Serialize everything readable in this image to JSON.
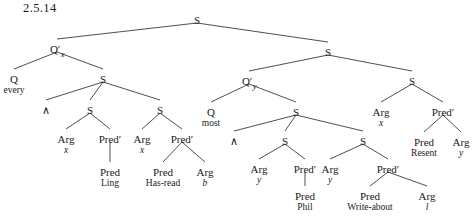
{
  "figure": {
    "example_number": "2.5.14",
    "width": 476,
    "height": 221,
    "edge_color": "#3a3a44",
    "text_color": "#1a1a1a"
  },
  "nodes": {
    "root_s": {
      "label": "S",
      "sub": "",
      "word": "",
      "x": 197,
      "y": 11
    },
    "left_qprime": {
      "label": "Q′",
      "sub": "x",
      "word": "",
      "x": 57,
      "y": 40
    },
    "left_q": {
      "label": "Q",
      "sub": "",
      "word": "every",
      "x": 14,
      "y": 70
    },
    "left_s1": {
      "label": "S",
      "sub": "",
      "word": "",
      "x": 103,
      "y": 70
    },
    "left_conj": {
      "label": "∧",
      "sub": "",
      "word": "",
      "x": 46,
      "y": 101
    },
    "left_s2": {
      "label": "S",
      "sub": "",
      "word": "",
      "x": 90,
      "y": 101
    },
    "left_s3": {
      "label": "S",
      "sub": "",
      "word": "",
      "x": 160,
      "y": 101
    },
    "left_arg_x1": {
      "label": "Arg",
      "sub": "",
      "word": "x",
      "x": 66,
      "y": 130
    },
    "left_predprime1": {
      "label": "Pred′",
      "sub": "",
      "word": "",
      "x": 110,
      "y": 130
    },
    "left_pred_ling": {
      "label": "Pred",
      "sub": "",
      "word": "Ling",
      "x": 110,
      "y": 163
    },
    "left_arg_x2": {
      "label": "Arg",
      "sub": "",
      "word": "x",
      "x": 142,
      "y": 130
    },
    "left_predprime2": {
      "label": "Pred′",
      "sub": "",
      "word": "",
      "x": 182,
      "y": 130
    },
    "left_pred_hasread": {
      "label": "Pred",
      "sub": "",
      "word": "Has-read",
      "x": 163,
      "y": 163
    },
    "left_arg_b": {
      "label": "Arg",
      "sub": "",
      "word": "b",
      "x": 205,
      "y": 163
    },
    "right_s": {
      "label": "S",
      "sub": "",
      "word": "",
      "x": 328,
      "y": 43
    },
    "right_qprime": {
      "label": "Q′",
      "sub": "y",
      "word": "",
      "x": 249,
      "y": 72
    },
    "right_q": {
      "label": "Q",
      "sub": "",
      "word": "most",
      "x": 211,
      "y": 103
    },
    "right_s1": {
      "label": "S",
      "sub": "",
      "word": "",
      "x": 296,
      "y": 103
    },
    "right_conj": {
      "label": "∧",
      "sub": "",
      "word": "",
      "x": 234,
      "y": 132
    },
    "right_s2": {
      "label": "S",
      "sub": "",
      "word": "",
      "x": 285,
      "y": 132
    },
    "right_s3": {
      "label": "S",
      "sub": "",
      "word": "",
      "x": 363,
      "y": 132
    },
    "right_arg_y1": {
      "label": "Arg",
      "sub": "",
      "word": "y",
      "x": 259,
      "y": 160
    },
    "right_predprime1": {
      "label": "Pred′",
      "sub": "",
      "word": "",
      "x": 305,
      "y": 160
    },
    "right_pred_phil": {
      "label": "Pred",
      "sub": "",
      "word": "Phil",
      "x": 305,
      "y": 187
    },
    "right_arg_y2": {
      "label": "Arg",
      "sub": "",
      "word": "y",
      "x": 330,
      "y": 160
    },
    "right_predprime2": {
      "label": "Pred′",
      "sub": "",
      "word": "",
      "x": 388,
      "y": 160
    },
    "right_pred_write": {
      "label": "Pred",
      "sub": "",
      "word": "Write-about",
      "x": 370,
      "y": 187
    },
    "right_arg_l": {
      "label": "Arg",
      "sub": "",
      "word": "l",
      "x": 427,
      "y": 187
    },
    "far_arg_x": {
      "label": "Arg",
      "sub": "",
      "word": "x",
      "x": 381,
      "y": 103
    },
    "far_predprime": {
      "label": "Pred′",
      "sub": "",
      "word": "",
      "x": 443,
      "y": 103
    },
    "far_pred_resent": {
      "label": "Pred",
      "sub": "",
      "word": "Resent",
      "x": 424,
      "y": 133
    },
    "far_arg_y": {
      "label": "Arg",
      "sub": "",
      "word": "y",
      "x": 461,
      "y": 133
    }
  },
  "edges": [
    {
      "from": "root_s",
      "to": "left_qprime"
    },
    {
      "from": "root_s",
      "to": "right_s"
    },
    {
      "from": "left_qprime",
      "to": "left_q"
    },
    {
      "from": "left_qprime",
      "to": "left_s1"
    },
    {
      "from": "left_s1",
      "to": "left_conj"
    },
    {
      "from": "left_s1",
      "to": "left_s2"
    },
    {
      "from": "left_s1",
      "to": "left_s3"
    },
    {
      "from": "left_s2",
      "to": "left_arg_x1"
    },
    {
      "from": "left_s2",
      "to": "left_predprime1"
    },
    {
      "from": "left_predprime1",
      "to": "left_pred_ling"
    },
    {
      "from": "left_s3",
      "to": "left_arg_x2"
    },
    {
      "from": "left_s3",
      "to": "left_predprime2"
    },
    {
      "from": "left_predprime2",
      "to": "left_pred_hasread"
    },
    {
      "from": "left_predprime2",
      "to": "left_arg_b"
    },
    {
      "from": "right_s",
      "to": "right_qprime"
    },
    {
      "from": "right_s",
      "to": "far_s"
    },
    {
      "from": "right_qprime",
      "to": "right_q"
    },
    {
      "from": "right_qprime",
      "to": "right_s1"
    },
    {
      "from": "right_s1",
      "to": "right_conj"
    },
    {
      "from": "right_s1",
      "to": "right_s2"
    },
    {
      "from": "right_s1",
      "to": "right_s3"
    },
    {
      "from": "right_s2",
      "to": "right_arg_y1"
    },
    {
      "from": "right_s2",
      "to": "right_predprime1"
    },
    {
      "from": "right_predprime1",
      "to": "right_pred_phil"
    },
    {
      "from": "right_s3",
      "to": "right_arg_y2"
    },
    {
      "from": "right_s3",
      "to": "right_predprime2"
    },
    {
      "from": "right_predprime2",
      "to": "right_pred_write"
    },
    {
      "from": "right_predprime2",
      "to": "right_arg_l"
    },
    {
      "from": "far_s",
      "to": "far_arg_x"
    },
    {
      "from": "far_s",
      "to": "far_predprime"
    },
    {
      "from": "far_predprime",
      "to": "far_pred_resent"
    },
    {
      "from": "far_predprime",
      "to": "far_arg_y"
    }
  ],
  "extra_nodes": {
    "far_s": {
      "label": "S",
      "sub": "",
      "word": "",
      "x": 412,
      "y": 72
    }
  }
}
